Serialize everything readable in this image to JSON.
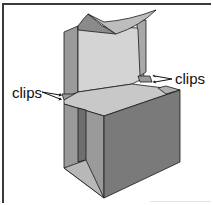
{
  "figure": {
    "labels": {
      "left_clip": "clips",
      "right_clip": "clips"
    },
    "colors": {
      "border": "#3a3a3a",
      "outline": "#1a1a1a",
      "front_face": "#7a7a7a",
      "side_face": "#9a9a9a",
      "inner_panel": "#d4d4d4",
      "top_face": "#c8c8c8",
      "flap_dark": "#8a8a8a",
      "flap_light": "#bdbdbd"
    }
  }
}
